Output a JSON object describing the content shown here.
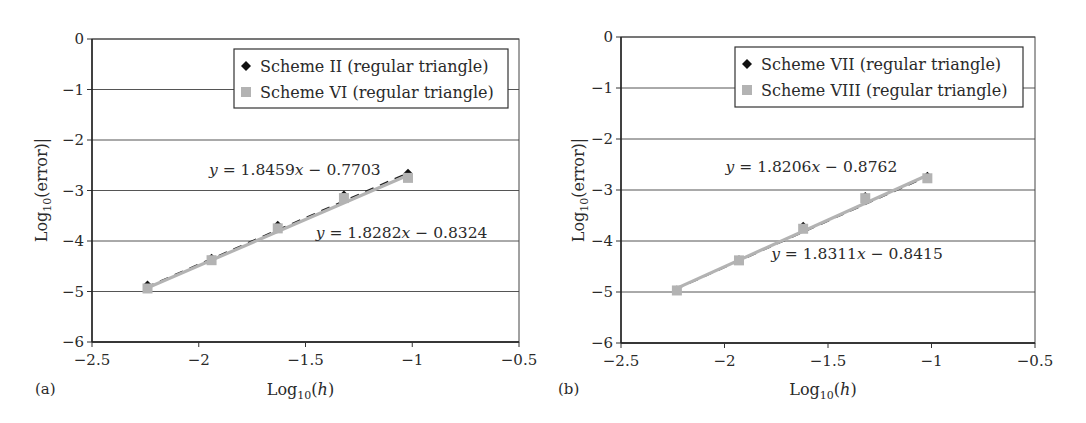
{
  "figure": {
    "panels": [
      "(a)",
      "(b)"
    ]
  },
  "chart_data": [
    {
      "type": "scatter",
      "panel_label": "(a)",
      "title": "",
      "xlabel": "Log10(h)",
      "ylabel": "Log10(error)|",
      "xlim": [
        -2.5,
        -0.5
      ],
      "ylim": [
        -6,
        0
      ],
      "xticks": [
        -2.5,
        -2,
        -1.5,
        -1,
        -0.5
      ],
      "xtick_labels": [
        "−2.5",
        "−2",
        "−1.5",
        "−1",
        "−0.5"
      ],
      "yticks": [
        0,
        -1,
        -2,
        -3,
        -4,
        -5,
        -6
      ],
      "ytick_labels": [
        "0",
        "−1",
        "−2",
        "−3",
        "−4",
        "−5",
        "−6"
      ],
      "grid": "horizontal",
      "legend_position": "upper right",
      "series": [
        {
          "name": "Scheme II (regular triangle)",
          "marker": "diamond",
          "color": "#111111",
          "trendline": "dashed",
          "x": [
            -2.24,
            -1.94,
            -1.63,
            -1.32,
            -1.02
          ],
          "y": [
            -4.86,
            -4.33,
            -3.68,
            -3.08,
            -2.65
          ],
          "fit_equation": "y = 1.8459x − 0.7703",
          "fit": {
            "slope": 1.8459,
            "intercept": -0.7703
          }
        },
        {
          "name": "Scheme VI (regular triangle)",
          "marker": "square",
          "color": "#b3b3b3",
          "trendline": "solid",
          "x": [
            -2.24,
            -1.94,
            -1.63,
            -1.32,
            -1.02
          ],
          "y": [
            -4.94,
            -4.38,
            -3.75,
            -3.15,
            -2.75
          ],
          "fit_equation": "y = 1.8282x − 0.8324",
          "fit": {
            "slope": 1.8282,
            "intercept": -0.8324
          }
        }
      ],
      "annotations": [
        {
          "text": "y = 1.8459x − 0.7703",
          "x": -1.55,
          "y": -2.7
        },
        {
          "text": "y = 1.8282x − 0.8324",
          "x": -1.05,
          "y": -3.95
        }
      ]
    },
    {
      "type": "scatter",
      "panel_label": "(b)",
      "title": "",
      "xlabel": "Log10(h)",
      "ylabel": "Log10(error)|",
      "xlim": [
        -2.5,
        -0.5
      ],
      "ylim": [
        -6,
        0
      ],
      "xticks": [
        -2.5,
        -2,
        -1.5,
        -1,
        -0.5
      ],
      "xtick_labels": [
        "−2.5",
        "−2",
        "−1.5",
        "−1",
        "−0.5"
      ],
      "yticks": [
        0,
        -1,
        -2,
        -3,
        -4,
        -5,
        -6
      ],
      "ytick_labels": [
        "0",
        "−1",
        "−2",
        "−3",
        "−4",
        "−5",
        "−6"
      ],
      "grid": "horizontal",
      "legend_position": "upper right",
      "series": [
        {
          "name": "Scheme VII (regular triangle)",
          "marker": "diamond",
          "color": "#111111",
          "trendline": "dashed",
          "x": [
            -2.23,
            -1.93,
            -1.62,
            -1.32,
            -1.02
          ],
          "y": [
            -4.95,
            -4.36,
            -3.7,
            -3.12,
            -2.72
          ],
          "fit_equation": "y = 1.8206x − 0.8762",
          "fit": {
            "slope": 1.8206,
            "intercept": -0.8762
          }
        },
        {
          "name": "Scheme VIII (regular triangle)",
          "marker": "square",
          "color": "#b3b3b3",
          "trendline": "solid",
          "x": [
            -2.23,
            -1.93,
            -1.62,
            -1.32,
            -1.02
          ],
          "y": [
            -4.97,
            -4.38,
            -3.76,
            -3.16,
            -2.77
          ],
          "fit_equation": "y = 1.8311x − 0.8415",
          "fit": {
            "slope": 1.8311,
            "intercept": -0.8415
          }
        }
      ],
      "annotations": [
        {
          "text": "y = 1.8206x − 0.8762",
          "x": -1.58,
          "y": -2.65
        },
        {
          "text": "y = 1.8311x − 0.8415",
          "x": -1.36,
          "y": -4.35
        }
      ]
    }
  ]
}
